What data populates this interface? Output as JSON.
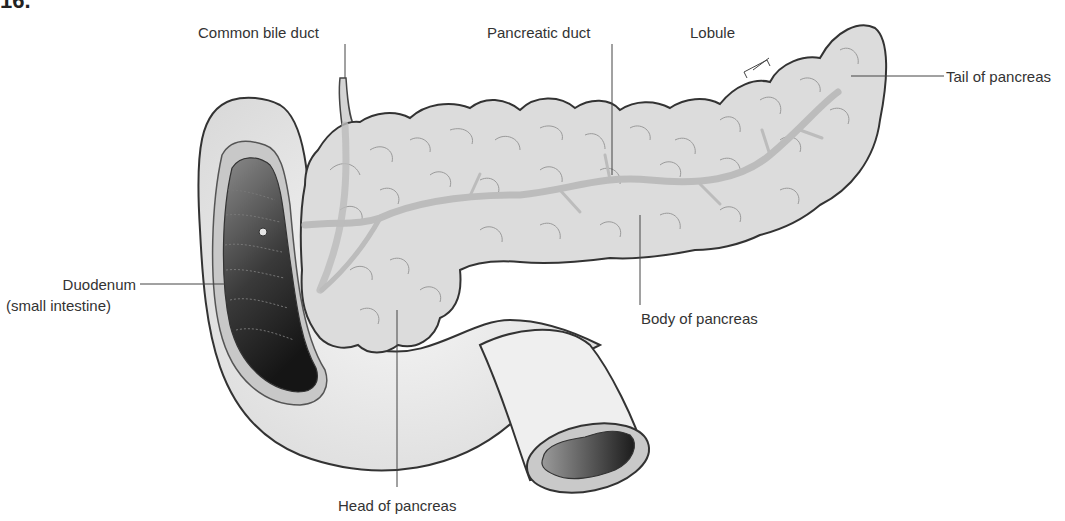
{
  "figure": {
    "number": "16."
  },
  "labels": {
    "common_bile_duct": "Common bile duct",
    "pancreatic_duct": "Pancreatic duct",
    "lobule": "Lobule",
    "tail": "Tail of pancreas",
    "duodenum_line1": "Duodenum",
    "duodenum_line2": "(small intestine)",
    "body": "Body of pancreas",
    "head": "Head of pancreas"
  },
  "colors": {
    "outline": "#333333",
    "pancreas_fill": "#dcdcdc",
    "duct": "#bdbdbd",
    "lobule_lines": "#8f8f8f",
    "intestine_fill": "#ececec",
    "lumen_dark": "#2a2a2a",
    "lumen_light": "#8a8a8a",
    "leader_line": "#444444"
  }
}
